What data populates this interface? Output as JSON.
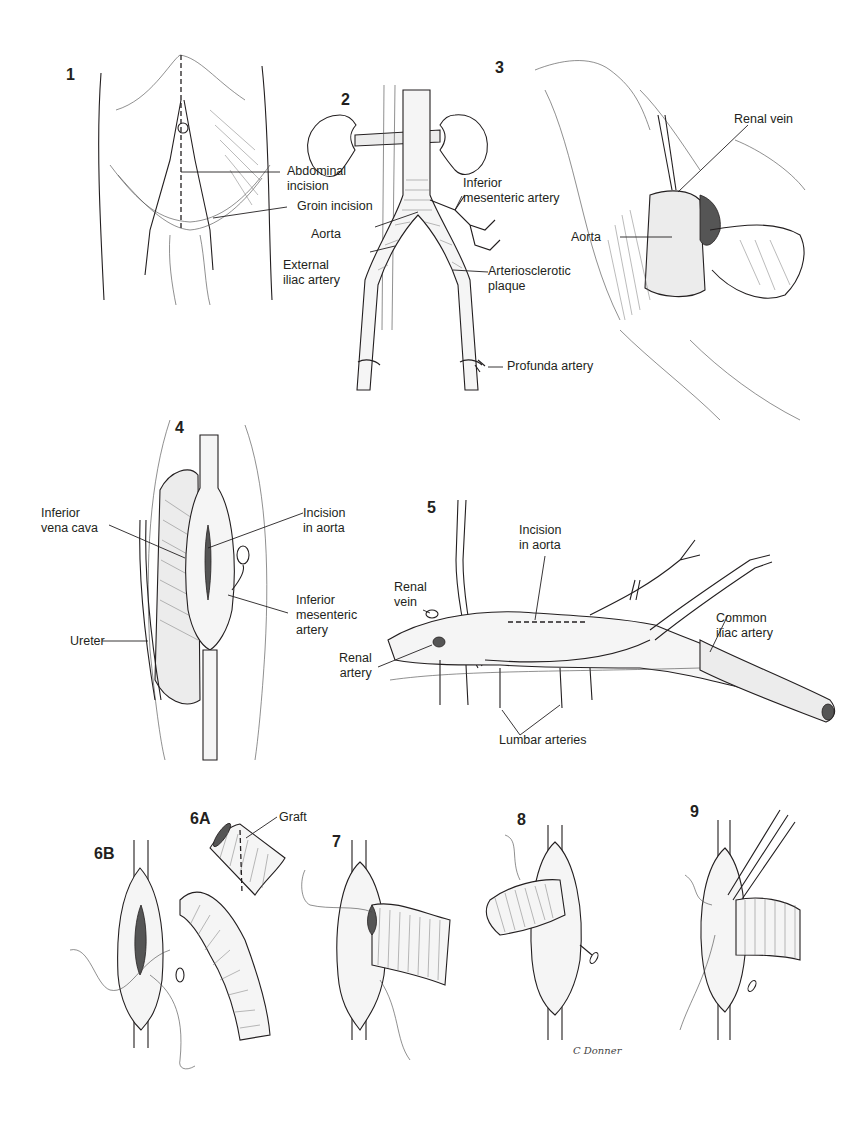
{
  "plate": {
    "title": "Aortobifemoral bypass surgical illustration",
    "artist_signature": "C Donner"
  },
  "panels": [
    {
      "id": "1",
      "labels": [
        "Abdominal\nincision",
        "Groin incision"
      ]
    },
    {
      "id": "2",
      "labels": [
        "Inferior\nmesenteric artery",
        "Aorta",
        "External\niliac artery",
        "Arteriosclerotic\nplaque",
        "Profunda artery"
      ]
    },
    {
      "id": "3",
      "labels": [
        "Renal vein",
        "Aorta"
      ]
    },
    {
      "id": "4",
      "labels": [
        "Inferior\nvena cava",
        "Incision\nin aorta",
        "Inferior\nmesenteric\nartery",
        "Ureter"
      ]
    },
    {
      "id": "5",
      "labels": [
        "Incision\nin aorta",
        "Renal\nvein",
        "Common\niliac artery",
        "Renal\nartery",
        "Lumbar arteries"
      ]
    },
    {
      "id": "6A",
      "labels": [
        "Graft"
      ]
    },
    {
      "id": "6B",
      "labels": []
    },
    {
      "id": "7",
      "labels": []
    },
    {
      "id": "8",
      "labels": []
    },
    {
      "id": "9",
      "labels": []
    }
  ],
  "text": {
    "n1": "1",
    "n2": "2",
    "n3": "3",
    "n4": "4",
    "n5": "5",
    "n6a": "6A",
    "n6b": "6B",
    "n7": "7",
    "n8": "8",
    "n9": "9",
    "p1_abdominal_1": "Abdominal",
    "p1_abdominal_2": "incision",
    "p1_groin": "Groin incision",
    "p2_ima_1": "Inferior",
    "p2_ima_2": "mesenteric artery",
    "p2_aorta": "Aorta",
    "p2_external_1": "External",
    "p2_external_2": "iliac artery",
    "p2_plaque_1": "Arteriosclerotic",
    "p2_plaque_2": "plaque",
    "p2_profunda": "Profunda artery",
    "p3_renal_vein": "Renal vein",
    "p3_aorta": "Aorta",
    "p4_ivc_1": "Inferior",
    "p4_ivc_2": "vena cava",
    "p4_incision_1": "Incision",
    "p4_incision_2": "in aorta",
    "p4_ima_1": "Inferior",
    "p4_ima_2": "mesenteric",
    "p4_ima_3": "artery",
    "p4_ureter": "Ureter",
    "p5_incision_1": "Incision",
    "p5_incision_2": "in aorta",
    "p5_renal_vein_1": "Renal",
    "p5_renal_vein_2": "vein",
    "p5_common_1": "Common",
    "p5_common_2": "iliac artery",
    "p5_renal_artery_1": "Renal",
    "p5_renal_artery_2": "artery",
    "p5_lumbar": "Lumbar arteries",
    "p6a_graft": "Graft",
    "signature": "C Donner"
  }
}
